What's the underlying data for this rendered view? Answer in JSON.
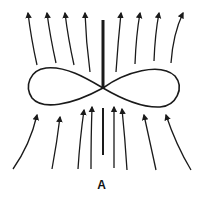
{
  "figure": {
    "label": "A",
    "stroke_color": "#1a1a1a",
    "background": "#ffffff"
  },
  "elements": {
    "central_bar_upper": {
      "x": 103,
      "y1": 20,
      "y2": 88
    },
    "central_bar_lower": {
      "x": 103,
      "y1": 108,
      "y2": 155
    },
    "figure_eight": {
      "center": [
        103,
        88
      ],
      "left_extent": 28,
      "right_extent": 178,
      "top": 68,
      "bottom": 108
    },
    "top_arrows": [
      {
        "tail": [
          37,
          65
        ],
        "head": [
          28,
          11
        ]
      },
      {
        "tail": [
          56,
          63
        ],
        "head": [
          47,
          11
        ]
      },
      {
        "tail": [
          74,
          65
        ],
        "head": [
          65,
          11
        ]
      },
      {
        "tail": [
          90,
          72
        ],
        "head": [
          85,
          11
        ]
      },
      {
        "tail": [
          116,
          72
        ],
        "head": [
          121,
          11
        ]
      },
      {
        "tail": [
          135,
          64
        ],
        "head": [
          140,
          11
        ]
      },
      {
        "tail": [
          154,
          61
        ],
        "head": [
          159,
          11
        ]
      },
      {
        "tail": [
          171,
          63
        ],
        "head": [
          183,
          11
        ]
      }
    ],
    "bottom_arrows": [
      {
        "tail": [
          13,
          169
        ],
        "head": [
          38,
          113
        ]
      },
      {
        "tail": [
          52,
          169
        ],
        "head": [
          61,
          115
        ]
      },
      {
        "tail": [
          78,
          169
        ],
        "head": [
          84,
          108
        ]
      },
      {
        "tail": [
          91,
          169
        ],
        "head": [
          92,
          105
        ]
      },
      {
        "tail": [
          114,
          168
        ],
        "head": [
          114,
          105
        ]
      },
      {
        "tail": [
          127,
          170
        ],
        "head": [
          122,
          107
        ]
      },
      {
        "tail": [
          156,
          170
        ],
        "head": [
          143,
          113
        ]
      },
      {
        "tail": [
          191,
          170
        ],
        "head": [
          165,
          113
        ]
      }
    ]
  }
}
